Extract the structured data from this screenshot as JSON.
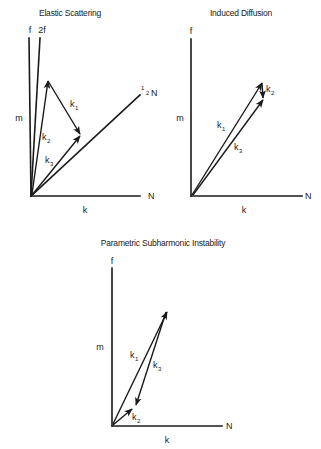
{
  "diagrams": [
    {
      "id": "elastic-scattering",
      "title": "Elastic Scattering",
      "axis_labels": {
        "vertical_top": "f",
        "vertical_left": "m",
        "horizontal_right": "N",
        "horizontal_below": "k"
      },
      "extra_lines": [
        {
          "label": "2f"
        },
        {
          "label_num": "1",
          "label_den": "2",
          "label_sym": "N"
        }
      ],
      "vectors": [
        {
          "name": "k",
          "sub": "1"
        },
        {
          "name": "k",
          "sub": "2"
        },
        {
          "name": "k",
          "sub": "3"
        }
      ]
    },
    {
      "id": "induced-diffusion",
      "title": "Induced Diffusion",
      "axis_labels": {
        "vertical_top": "f",
        "vertical_left": "m",
        "horizontal_right": "N",
        "horizontal_below": "k"
      },
      "vectors": [
        {
          "name": "k",
          "sub": "1"
        },
        {
          "name": "k",
          "sub": "2"
        },
        {
          "name": "k",
          "sub": "3"
        }
      ]
    },
    {
      "id": "parametric-subharmonic-instability",
      "title": "Parametric Subharmonic Instability",
      "axis_labels": {
        "vertical_top": "f",
        "vertical_left": "m",
        "horizontal_right": "N",
        "horizontal_below": "k"
      },
      "vectors": [
        {
          "name": "k",
          "sub": "1"
        },
        {
          "name": "k",
          "sub": "2"
        },
        {
          "name": "k",
          "sub": "3"
        }
      ]
    }
  ]
}
